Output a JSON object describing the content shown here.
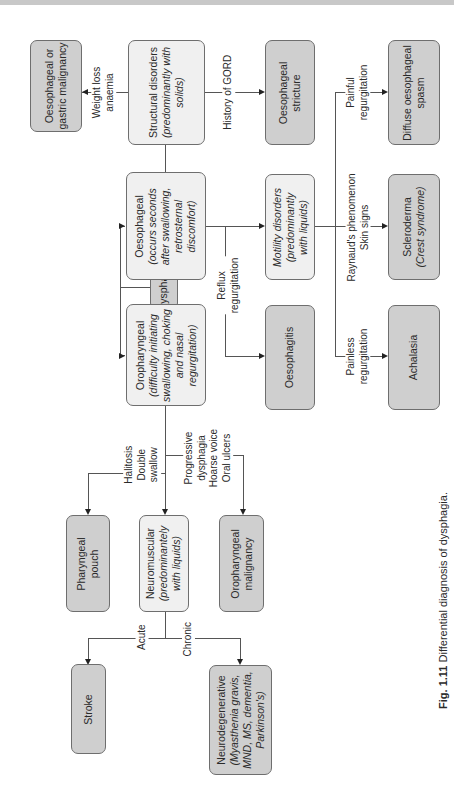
{
  "figure": {
    "caption_number": "Fig. 1.11",
    "caption_text": "Differential diagnosis of dysphagia.",
    "orientation": "rotated 90° counter-clockwise"
  },
  "nodes": {
    "dysphagia": {
      "title": "Dysphagia"
    },
    "oropharyngeal": {
      "title": "Oropharyngeal",
      "detail_1": "(difficulty initiating",
      "detail_2": "swallowing, choking",
      "detail_3": "and nasal",
      "detail_4": "regurgitation)"
    },
    "oesophageal": {
      "title": "Oesophageal",
      "detail_1": "(occurs seconds",
      "detail_2": "after swallowing,",
      "detail_3": "retrosternal",
      "detail_4": "discomfort)"
    },
    "structural": {
      "title": "Structural disorders",
      "detail_1": "(predominantly with",
      "detail_2": "solids)"
    },
    "gastric_malignancy": {
      "line_1": "Oesophageal or",
      "line_2": "gastric malignancy"
    },
    "stricture": {
      "line_1": "Oesophageal",
      "line_2": "stricture"
    },
    "motility": {
      "line_1": "Motility disorders",
      "line_2": "(predominantly",
      "line_3": "with liquids)"
    },
    "oesophagitis": {
      "title": "Oesophagitis"
    },
    "diffuse_spasm": {
      "line_1": "Diffuse oesophageal",
      "line_2": "spasm"
    },
    "scleroderma": {
      "line_1": "Scleroderma",
      "line_2": "(Crest syndrome)"
    },
    "achalasia": {
      "title": "Achalasia"
    },
    "pharyngeal_pouch": {
      "line_1": "Pharyngeal",
      "line_2": "pouch"
    },
    "neuromuscular": {
      "title": "Neuromuscular",
      "detail_1": "(predominantely",
      "detail_2": "with liquids)"
    },
    "oropharyngeal_malignancy": {
      "line_1": "Oropharyngeal",
      "line_2": "malignancy"
    },
    "stroke": {
      "title": "Stroke"
    },
    "neurodegenerative": {
      "title": "Neurodegenerative",
      "detail_1": "(Myasthenia gravis,",
      "detail_2": "MND, MS, dementia,",
      "detail_3": "Parkinson's)"
    }
  },
  "edge_labels": {
    "weight_loss": {
      "line_1": "Weight loss",
      "line_2": "anaemia"
    },
    "history_gord": {
      "line_1": "History of GORD"
    },
    "painful": {
      "line_1": "Painful",
      "line_2": "regurgitation"
    },
    "raynaud": {
      "line_1": "Raynaud's phenomenon",
      "line_2": "Skin signs"
    },
    "painless": {
      "line_1": "Painless",
      "line_2": "regurgitation"
    },
    "reflux": {
      "line_1": "Reflux",
      "line_2": "regurgitation"
    },
    "halitosis": {
      "line_1": "Halitosis",
      "line_2": "Double",
      "line_3": "swallow"
    },
    "progressive": {
      "line_1": "Progressive",
      "line_2": "dysphagia",
      "line_3": "Hoarse voice",
      "line_4": "Oral ulcers"
    },
    "acute": {
      "line_1": "Acute"
    },
    "chronic": {
      "line_1": "Chronic"
    }
  },
  "colors": {
    "dark_node": "#cfcfcf",
    "light_node": "#f0f0f0",
    "border": "#6e6e6e",
    "line": "#555555"
  }
}
